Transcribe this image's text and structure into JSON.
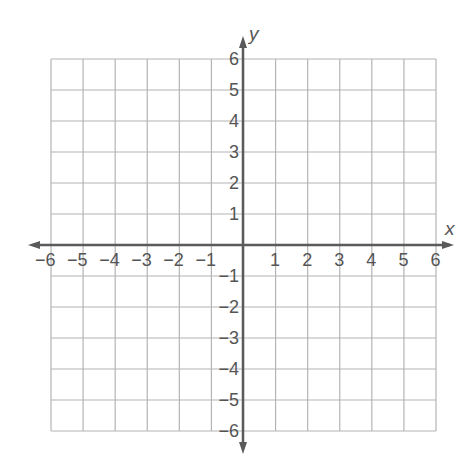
{
  "diagram": {
    "type": "coordinate-plane",
    "x_axis": {
      "label": "x",
      "min": -6,
      "max": 6,
      "ticks": [
        "-6",
        "-5",
        "-4",
        "-3",
        "-2",
        "-1",
        "1",
        "2",
        "3",
        "4",
        "5",
        "6"
      ],
      "tick_display": [
        "−6",
        "−5",
        "−4",
        "−3",
        "−2",
        "−1",
        "1",
        "2",
        "3",
        "4",
        "5",
        "6"
      ]
    },
    "y_axis": {
      "label": "y",
      "min": -6,
      "max": 6,
      "ticks": [
        "6",
        "5",
        "4",
        "3",
        "2",
        "1",
        "-1",
        "-2",
        "-3",
        "-4",
        "-5",
        "-6"
      ],
      "tick_display": [
        "6",
        "5",
        "4",
        "3",
        "2",
        "1",
        "−1",
        "−2",
        "−3",
        "−4",
        "−5",
        "−6"
      ]
    },
    "grid": {
      "rows": 12,
      "cols": 12,
      "visible": true
    },
    "colors": {
      "grid_line": "#b4b4b4",
      "axis_line": "#5a5a5a",
      "text": "#555555",
      "background": "#ffffff"
    }
  }
}
